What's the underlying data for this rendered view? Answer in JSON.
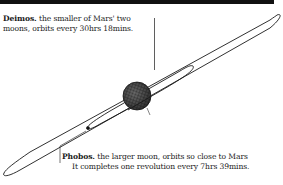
{
  "diagram": {
    "colors": {
      "top_bar": "#111111",
      "orbit_line": "#1a1a1a",
      "mars_fill": "#555555",
      "text": "#1a1a1a"
    },
    "bodies": [
      {
        "name": "Mars",
        "type": "planet"
      },
      {
        "name": "Deimos",
        "type": "moon",
        "orbit": "outer"
      },
      {
        "name": "Phobos",
        "type": "moon",
        "orbit": "inner"
      }
    ]
  },
  "labels": {
    "deimos": {
      "name": "Deimos.",
      "line1_rest": " the smaller of Mars' two",
      "line2": "moons, orbits every 30hrs 18mins."
    },
    "phobos": {
      "name": "Phobos.",
      "line1_rest": " the larger moon, orbits so close to Mars",
      "line2": "It completes one revolution every 7hrs 39mins."
    }
  }
}
